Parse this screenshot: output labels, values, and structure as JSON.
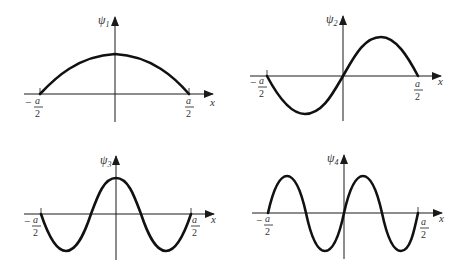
{
  "figure": {
    "panels": [
      {
        "id": "psi1",
        "y_label": "ψ",
        "y_label_sub": "1",
        "x_label": "x",
        "left_bound": {
          "sign": "−",
          "num": "a",
          "den": "2"
        },
        "right_bound": {
          "num": "a",
          "den": "2"
        },
        "half_wavelengths": 1,
        "parity": "even"
      },
      {
        "id": "psi2",
        "y_label": "ψ",
        "y_label_sub": "2",
        "x_label": "x",
        "left_bound": {
          "sign": "−",
          "num": "a",
          "den": "2"
        },
        "right_bound": {
          "num": "a",
          "den": "2"
        },
        "half_wavelengths": 2,
        "parity": "odd"
      },
      {
        "id": "psi3",
        "y_label": "ψ",
        "y_label_sub": "3",
        "x_label": "x",
        "left_bound": {
          "sign": "−",
          "num": "a",
          "den": "2"
        },
        "right_bound": {
          "num": "a",
          "den": "2"
        },
        "half_wavelengths": 3,
        "parity": "even"
      },
      {
        "id": "psi4",
        "y_label": "ψ",
        "y_label_sub": "4",
        "x_label": "x",
        "left_bound": {
          "sign": "−",
          "num": "a",
          "den": "2"
        },
        "right_bound": {
          "num": "a",
          "den": "2"
        },
        "half_wavelengths": 4,
        "parity": "odd"
      }
    ]
  }
}
